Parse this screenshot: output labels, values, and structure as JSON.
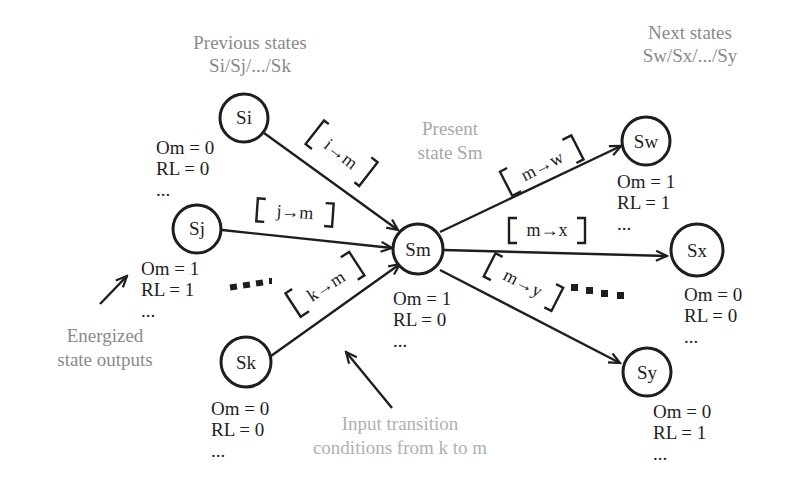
{
  "headers": {
    "previous_title": "Previous states",
    "previous_list": "Si/Sj/.../Sk",
    "next_title": "Next states",
    "next_list": "Sw/Sx/.../Sy",
    "present_line1": "Present",
    "present_line2": "state Sm"
  },
  "annotations": {
    "energized_line1": "Energized",
    "energized_line2": "state outputs",
    "input_line1": "Input transition",
    "input_line2": "conditions from k to m"
  },
  "nodes": {
    "si": {
      "label": "Si",
      "om": "Om = 0",
      "rl": "RL = 0",
      "more": "..."
    },
    "sj": {
      "label": "Sj",
      "om": "Om = 1",
      "rl": "RL = 1",
      "more": "..."
    },
    "sk": {
      "label": "Sk",
      "om": "Om = 0",
      "rl": "RL = 0",
      "more": "..."
    },
    "sm": {
      "label": "Sm",
      "om": "Om = 1",
      "rl": "RL = 0",
      "more": "..."
    },
    "sw": {
      "label": "Sw",
      "om": "Om = 1",
      "rl": "RL = 1",
      "more": "..."
    },
    "sx": {
      "label": "Sx",
      "om": "Om = 0",
      "rl": "RL = 0",
      "more": "..."
    },
    "sy": {
      "label": "Sy",
      "om": "Om = 0",
      "rl": "RL = 1",
      "more": "..."
    }
  },
  "transitions": {
    "i_m": "i→m",
    "j_m": "j→m",
    "k_m": "k→m",
    "m_w": "m→w",
    "m_x": "m→x",
    "m_y": "m→y"
  },
  "colors": {
    "ink": "#1e1e1e",
    "annotation_grey": "#8a8a8a",
    "background": "#ffffff"
  }
}
